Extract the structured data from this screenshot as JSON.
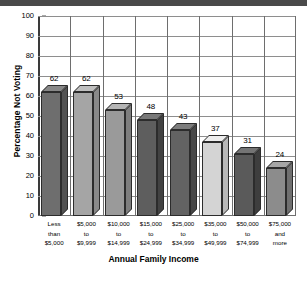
{
  "chart_data": {
    "type": "bar",
    "title": "",
    "xlabel": "Annual Family Income",
    "ylabel": "Percentage Not Voting",
    "categories": [
      "Less\nthan\n$5,000",
      "$5,000\nto\n$9,999",
      "$10,000\nto\n$14,999",
      "$15,000\nto\n$24,999",
      "$25,000\nto\n$34,999",
      "$35,000\nto\n$49,999",
      "$50,000\nto\n$74,999",
      "$75,000\nand\nmore"
    ],
    "category_lines": [
      [
        "Less",
        "than",
        "$5,000"
      ],
      [
        "$5,000",
        "to",
        "$9,999"
      ],
      [
        "$10,000",
        "to",
        "$14,999"
      ],
      [
        "$15,000",
        "to",
        "$24,999"
      ],
      [
        "$25,000",
        "to",
        "$34,999"
      ],
      [
        "$35,000",
        "to",
        "$49,999"
      ],
      [
        "$50,000",
        "to",
        "$74,999"
      ],
      [
        "$75,000",
        "and",
        "more"
      ]
    ],
    "values": [
      62,
      62,
      53,
      48,
      43,
      37,
      31,
      24
    ],
    "bar_colors": [
      "#6e6e6e",
      "#a5a5a5",
      "#9a9a9a",
      "#5e5e5e",
      "#636363",
      "#d4d4d4",
      "#5a5a5a",
      "#8c8c8c"
    ],
    "ylim": [
      0,
      100
    ],
    "ytick_step": 10,
    "yticks": [
      0,
      10,
      20,
      30,
      40,
      50,
      60,
      70,
      80,
      90,
      100
    ],
    "grid": true,
    "legend": "none"
  },
  "colors": {
    "axis": "#3a3a3a",
    "grid": "#8e8e8e",
    "bar_outline": "#2c2c2c",
    "top_strip": "#4a4a4a",
    "background": "#ffffff"
  }
}
